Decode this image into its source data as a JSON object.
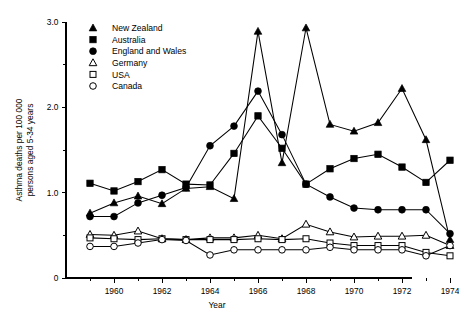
{
  "chart_data": {
    "type": "line",
    "title": "",
    "xlabel": "Year",
    "ylabel": "Asthma deaths per 100 000 persons aged 5-34 years",
    "ylabel_line1": "Asthma deaths per 100 000",
    "ylabel_line2": "persons aged 5-34 years",
    "x": [
      1959,
      1960,
      1961,
      1962,
      1963,
      1964,
      1965,
      1966,
      1967,
      1968,
      1969,
      1970,
      1971,
      1972,
      1973,
      1974
    ],
    "xlim": [
      1958.5,
      1974.5
    ],
    "ylim": [
      0,
      3.0
    ],
    "ytick_labels": [
      "0",
      "1.0",
      "2.0",
      "3.0"
    ],
    "ytick_values": [
      0,
      1.0,
      2.0,
      3.0
    ],
    "yminor_values": [
      0.5,
      1.5,
      2.5
    ],
    "xtick_labels": [
      "1960",
      "1962",
      "1964",
      "1966",
      "1968",
      "1970",
      "1972",
      "1974"
    ],
    "xtick_values": [
      1960,
      1962,
      1964,
      1966,
      1968,
      1970,
      1972,
      1974
    ],
    "xminor_values": [
      1959,
      1961,
      1963,
      1965,
      1967,
      1969,
      1971,
      1973
    ],
    "grid": false,
    "legend_position": "top-left-inside",
    "series": [
      {
        "name": "New Zealand",
        "marker": "triangle-filled",
        "values": [
          0.76,
          0.88,
          0.96,
          0.87,
          1.05,
          1.07,
          0.93,
          2.89,
          1.35,
          2.93,
          1.8,
          1.72,
          1.82,
          2.22,
          1.62,
          0.45
        ]
      },
      {
        "name": "Australia",
        "marker": "square-filled",
        "values": [
          1.11,
          1.02,
          1.13,
          1.27,
          1.1,
          1.09,
          1.46,
          1.9,
          1.52,
          1.1,
          1.28,
          1.4,
          1.45,
          1.3,
          1.12,
          1.38
        ]
      },
      {
        "name": "England  and Wales",
        "marker": "circle-filled",
        "values": [
          0.72,
          0.72,
          0.88,
          0.97,
          1.06,
          1.55,
          1.78,
          2.19,
          1.68,
          1.1,
          0.95,
          0.82,
          0.8,
          0.8,
          0.8,
          0.52
        ]
      },
      {
        "name": "Germany",
        "marker": "triangle-open",
        "values": [
          0.51,
          0.5,
          0.55,
          0.46,
          0.45,
          0.47,
          0.47,
          0.5,
          0.46,
          0.63,
          0.54,
          0.48,
          0.49,
          0.49,
          0.5,
          0.38
        ]
      },
      {
        "name": "USA",
        "marker": "square-open",
        "values": [
          0.47,
          0.46,
          0.45,
          0.46,
          0.45,
          0.45,
          0.45,
          0.46,
          0.45,
          0.46,
          0.41,
          0.38,
          0.38,
          0.38,
          0.3,
          0.26
        ]
      },
      {
        "name": "Canada",
        "marker": "circle-open",
        "values": [
          0.37,
          0.37,
          0.41,
          0.45,
          0.44,
          0.27,
          0.33,
          0.33,
          0.33,
          0.33,
          0.36,
          0.33,
          0.33,
          0.33,
          0.26,
          0.38
        ]
      }
    ]
  },
  "legend": {
    "items": [
      {
        "label": "New Zealand",
        "marker": "triangle-filled"
      },
      {
        "label": "Australia",
        "marker": "square-filled"
      },
      {
        "label": "England  and Wales",
        "marker": "circle-filled"
      },
      {
        "label": "Germany",
        "marker": "triangle-open"
      },
      {
        "label": "USA",
        "marker": "square-open"
      },
      {
        "label": "Canada",
        "marker": "circle-open"
      }
    ]
  }
}
